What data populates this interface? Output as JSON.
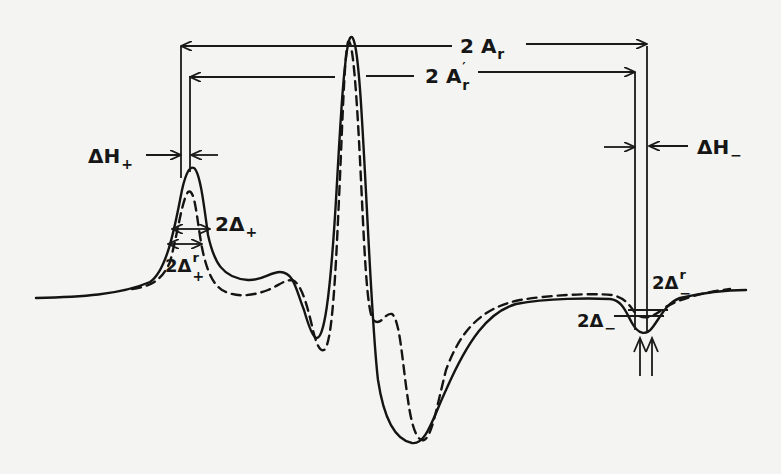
{
  "figure": {
    "colors": {
      "ink": "#141414",
      "paper": "#f4f4f2"
    },
    "curves": [
      {
        "name": "solid-curve",
        "style": "solid"
      },
      {
        "name": "dashed-curve",
        "style": "dashed"
      }
    ],
    "labels": {
      "two_a_r": {
        "prefix": "2 A",
        "sub": "r"
      },
      "two_a_r_prime": {
        "prefix": "2 A",
        "sup": "′",
        "sub": "r"
      },
      "delta_h_plus": {
        "prefix": "ΔH",
        "sub": "+"
      },
      "delta_h_minus": {
        "prefix": "ΔH",
        "sub": "−"
      },
      "two_delta_plus": {
        "prefix": "2Δ",
        "sub": "+"
      },
      "two_delta_plus_r": {
        "prefix": "2Δ",
        "sup": "r",
        "sub": "+"
      },
      "two_delta_minus": {
        "prefix": "2Δ",
        "sub": "−"
      },
      "two_delta_minus_r": {
        "prefix": "2Δ",
        "sup": "r",
        "sub": "−"
      }
    }
  }
}
